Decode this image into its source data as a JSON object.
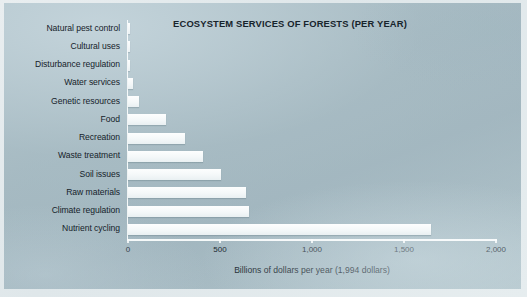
{
  "chart_data": {
    "type": "bar",
    "orientation": "horizontal",
    "title": "ECOSYSTEM SERVICES OF FORESTS (PER YEAR)",
    "xlabel": "Billions of dollars per year (1,994 dollars)",
    "ylabel": "",
    "xlim": [
      0,
      2000
    ],
    "xticks": [
      0,
      500,
      1000,
      1500,
      2000
    ],
    "xtick_labels": [
      "0",
      "500",
      "1,000",
      "1,500",
      "2,000"
    ],
    "grid": false,
    "legend": null,
    "categories": [
      "Natural pest control",
      "Cultural uses",
      "Disturbance regulation",
      "Water services",
      "Genetic resources",
      "Food",
      "Recreation",
      "Waste treatment",
      "Soil issues",
      "Raw materials",
      "Climate regulation",
      "Nutrient cycling"
    ],
    "values": [
      10,
      10,
      12,
      25,
      60,
      205,
      310,
      410,
      505,
      640,
      655,
      1645
    ],
    "bar_color": "#fbfdfd",
    "background_color": "#a6bac2",
    "text_color": "#16232b"
  },
  "figure": {
    "frame_color": "#e6edef"
  }
}
